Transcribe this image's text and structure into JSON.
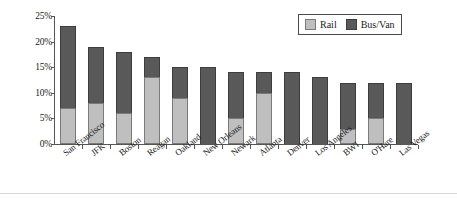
{
  "chart_data": {
    "type": "bar",
    "subtype": "stacked-vertical",
    "title": "",
    "xlabel": "",
    "ylabel": "",
    "ylim": [
      0,
      25
    ],
    "ytick_labels": [
      "0%",
      "5%",
      "10%",
      "15%",
      "20%",
      "25%"
    ],
    "ytick_values": [
      0,
      5,
      10,
      15,
      20,
      25
    ],
    "grid": false,
    "legend_position": "top-right",
    "categories": [
      "San Francisco",
      "JFK",
      "Boston",
      "Reagan",
      "Oakland",
      "New Orleans",
      "Newark",
      "Atlanta",
      "Denver",
      "Los Angeles",
      "BWI",
      "O'Hare",
      "Las Vegas"
    ],
    "series": [
      {
        "name": "Rail",
        "color": "#bfbfbf",
        "values": [
          7,
          8,
          6,
          13,
          9,
          0,
          5,
          10,
          0,
          0,
          3,
          5,
          0
        ]
      },
      {
        "name": "Bus/Van",
        "color": "#595959",
        "values": [
          16,
          11,
          12,
          4,
          6,
          15,
          9,
          4,
          14,
          13,
          9,
          7,
          12
        ]
      }
    ],
    "totals": [
      23,
      19,
      18,
      17,
      15,
      15,
      14,
      14,
      14,
      13,
      12,
      12,
      12
    ]
  },
  "legend": {
    "items": [
      {
        "label": "Rail",
        "color": "#bfbfbf"
      },
      {
        "label": "Bus/Van",
        "color": "#595959"
      }
    ]
  }
}
